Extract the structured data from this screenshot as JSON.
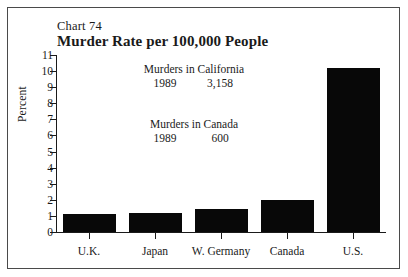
{
  "figure": {
    "chart_number": "Chart 74",
    "title": "Murder Rate per 100,000 People"
  },
  "annotations": [
    {
      "id": "california",
      "heading": "Murders in California",
      "year": "1989",
      "value": "3,158"
    },
    {
      "id": "canada",
      "heading": "Murders in Canada",
      "year": "1989",
      "value": "600"
    }
  ],
  "colors": {
    "bar": "#080808",
    "axis": "#1a1a1a",
    "frame": "#4a4a4a",
    "background": "#ffffff"
  },
  "chart_data": {
    "type": "bar",
    "title": "Murder Rate per 100,000 People",
    "subtitle": "Chart 74",
    "xlabel": "",
    "ylabel": "Percent",
    "categories": [
      "U.K.",
      "Japan",
      "W. Germany",
      "Canada",
      "U.S."
    ],
    "values": [
      1.1,
      1.2,
      1.4,
      2.0,
      10.2
    ],
    "ylim": [
      0,
      11
    ],
    "ytick_labels": [
      "0",
      "1",
      "2",
      "3",
      "4",
      "5",
      "6",
      "7",
      "8",
      "9",
      "10",
      "11"
    ],
    "ytick_values": [
      0,
      1,
      2,
      3,
      4,
      5,
      6,
      7,
      8,
      9,
      10,
      11
    ],
    "grid": false,
    "legend": null,
    "annotations": [
      "Murders in California 1989 3,158",
      "Murders in Canada 1989 600"
    ]
  }
}
